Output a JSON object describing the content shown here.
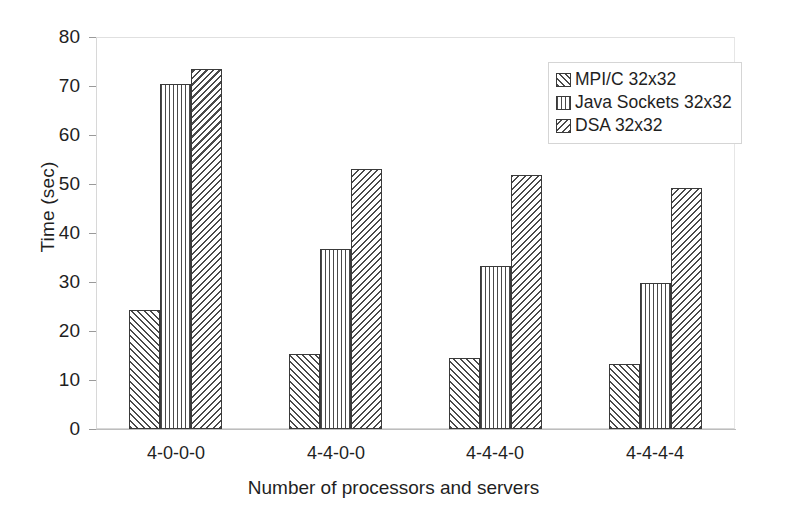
{
  "chart_data": {
    "type": "bar",
    "title": "",
    "xlabel": "Number of processors and servers",
    "ylabel": "Time (sec)",
    "categories": [
      "4-0-0-0",
      "4-4-0-0",
      "4-4-4-0",
      "4-4-4-4"
    ],
    "series": [
      {
        "name": "MPI/C 32x32",
        "pattern": "forward-diagonal-hatch",
        "values": [
          24.3,
          15.4,
          14.5,
          13.3
        ]
      },
      {
        "name": "Java Sockets 32x32",
        "pattern": "vertical-lines",
        "values": [
          70.5,
          36.7,
          33.2,
          29.8
        ]
      },
      {
        "name": "DSA 32x32",
        "pattern": "backward-diagonal-hatch",
        "values": [
          73.4,
          53.1,
          51.8,
          49.1
        ]
      }
    ],
    "ylim": [
      0,
      80
    ],
    "yticks": [
      0,
      10,
      20,
      30,
      40,
      50,
      60,
      70,
      80
    ],
    "grid": true,
    "legend_position": "top-right",
    "colors": {
      "bar_outline": "#3a3a3a",
      "hatch": "#4a4a4a",
      "gridline": "#d9d9d9",
      "axis": "#b9b9b9",
      "text": "#1f1f1f",
      "background": "#ffffff"
    }
  },
  "axes": {
    "y_tick_labels": [
      "80",
      "70",
      "60",
      "50",
      "40",
      "30",
      "20",
      "10",
      "0"
    ],
    "y_title": "Time (sec)",
    "x_tick_labels": [
      "4-0-0-0",
      "4-4-0-0",
      "4-4-4-0",
      "4-4-4-4"
    ],
    "x_title": "Number of processors and servers"
  },
  "legend": {
    "entries": [
      {
        "label": "MPI/C 32x32"
      },
      {
        "label": "Java Sockets 32x32"
      },
      {
        "label": "DSA 32x32"
      }
    ]
  }
}
